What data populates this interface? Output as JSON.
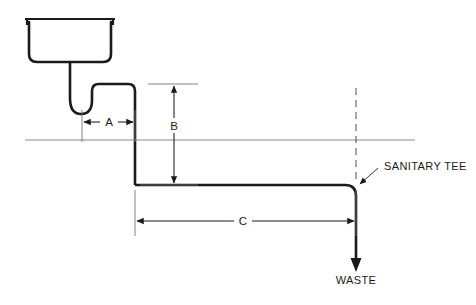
{
  "diagram": {
    "type": "plumbing-schematic",
    "background_color": "#ffffff",
    "line_color": "#1a1a1a",
    "reference_line_color": "#8a8a8a",
    "dimensions": [
      {
        "id": "A",
        "label": "A",
        "orientation": "horizontal",
        "description": "Horizontal distance from trap outlet to vertical drop pipe"
      },
      {
        "id": "B",
        "label": "B",
        "orientation": "vertical",
        "description": "Vertical drop from trap arm level to horizontal waste branch"
      },
      {
        "id": "C",
        "label": "C",
        "orientation": "horizontal",
        "description": "Horizontal run of waste branch to sanitary tee"
      }
    ],
    "callouts": [
      {
        "id": "sanitary-tee",
        "label": "SANITARY TEE",
        "has_leader_arrow": true
      },
      {
        "id": "waste",
        "label": "WASTE",
        "has_leader_arrow": false
      }
    ]
  }
}
